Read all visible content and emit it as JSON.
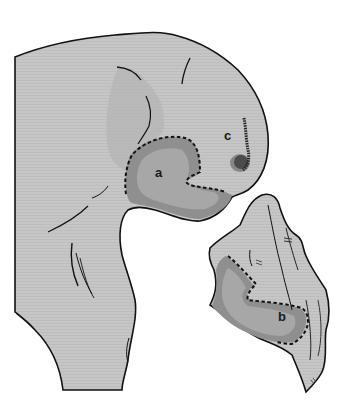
{
  "figure": {
    "type": "anatomical-illustration",
    "labels": [
      {
        "id": "a",
        "text": "a",
        "x": 155,
        "y": 166
      },
      {
        "id": "b",
        "text": "b",
        "x": 278,
        "y": 310
      },
      {
        "id": "c",
        "text": "c",
        "x": 224,
        "y": 129
      }
    ],
    "regions": [
      {
        "id": "a",
        "description": "dashed-outline shaded region on upper structure"
      },
      {
        "id": "b",
        "description": "dashed-outline shaded region on lower fragment"
      },
      {
        "id": "c",
        "description": "stippled mark region"
      }
    ]
  },
  "colors": {
    "background": "#ffffff",
    "base_fill": "#c4c4c4",
    "shade_light": "#b5b5b5",
    "shade_region_outer": "#8e8e8e",
    "shade_region_inner": "#a6a6a6",
    "outline": "#111111"
  }
}
